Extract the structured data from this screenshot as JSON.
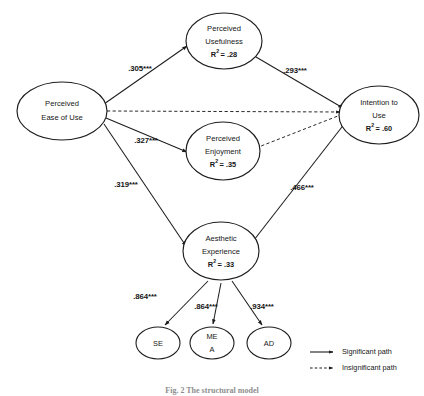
{
  "figure": {
    "type": "structural-equation-model-path-diagram",
    "caption": "Fig. 2 The structural model"
  },
  "nodes": {
    "ease_of_use": {
      "id": "perceived-ease-of-use",
      "line1": "Perceived",
      "line2": "Ease of Use",
      "r2": ""
    },
    "usefulness": {
      "id": "perceived-usefulness",
      "line1": "Perceived",
      "line2": "Usefulness",
      "r2_prefix": "R",
      "r2_sup": "2",
      "r2_value": "= .28",
      "r2": "R² = .28"
    },
    "enjoyment": {
      "id": "perceived-enjoyment",
      "line1": "Perceived",
      "line2": "Enjoyment",
      "r2_prefix": "R",
      "r2_sup": "2",
      "r2_value": "= .35",
      "r2": "R² = .35"
    },
    "aesthetic": {
      "id": "aesthetic-experience",
      "line1": "Aesthetic",
      "line2": "Experience",
      "r2_prefix": "R",
      "r2_sup": "2",
      "r2_value": "= .33",
      "r2": "R² = .33"
    },
    "intention": {
      "id": "intention-to-use",
      "line1": "Intention to",
      "line2": "Use",
      "r2_prefix": "R",
      "r2_sup": "2",
      "r2_value": "=  .60",
      "r2": "R²= .60"
    }
  },
  "indicators": [
    {
      "id": "se",
      "line1": "SE",
      "line2": ""
    },
    {
      "id": "mea",
      "line1": "ME",
      "line2": "A"
    },
    {
      "id": "ad",
      "line1": "AD",
      "line2": ""
    }
  ],
  "paths": [
    {
      "id": "eou-to-pu",
      "from": "Perceived Ease of Use",
      "to": "Perceived Usefulness",
      "coefficient": ".305***",
      "significance": "significant",
      "style": "solid"
    },
    {
      "id": "eou-to-pe",
      "from": "Perceived Ease of Use",
      "to": "Perceived Enjoyment",
      "coefficient": ".327***",
      "significance": "significant",
      "style": "solid"
    },
    {
      "id": "eou-to-ae",
      "from": "Perceived Ease of Use",
      "to": "Aesthetic Experience",
      "coefficient": ".319***",
      "significance": "significant",
      "style": "solid"
    },
    {
      "id": "eou-to-iu",
      "from": "Perceived Ease of Use",
      "to": "Intention to Use",
      "coefficient": "",
      "significance": "insignificant",
      "style": "dashed"
    },
    {
      "id": "pu-to-iu",
      "from": "Perceived Usefulness",
      "to": "Intention to Use",
      "coefficient": ".293***",
      "significance": "significant",
      "style": "solid"
    },
    {
      "id": "pe-to-iu",
      "from": "Perceived Enjoyment",
      "to": "Intention to Use",
      "coefficient": "",
      "significance": "insignificant",
      "style": "dashed"
    },
    {
      "id": "ae-to-iu",
      "from": "Aesthetic Experience",
      "to": "Intention to Use",
      "coefficient": ".466***",
      "significance": "significant",
      "style": "solid"
    }
  ],
  "loadings": [
    {
      "id": "ae-to-se",
      "from": "Aesthetic Experience",
      "to": "SE",
      "coefficient": ".864***"
    },
    {
      "id": "ae-to-mea",
      "from": "Aesthetic Experience",
      "to": "MEA",
      "coefficient": ".864***"
    },
    {
      "id": "ae-to-ad",
      "from": "Aesthetic Experience",
      "to": "AD",
      "coefficient": ".934***"
    }
  ],
  "legend": {
    "significant_label": "Significant path",
    "insignificant_label": "Insignificant path"
  },
  "colors": {
    "stroke": "#1d1d1d",
    "text": "#161616",
    "background": "#ffffff",
    "caption": "#8e8e8e"
  }
}
